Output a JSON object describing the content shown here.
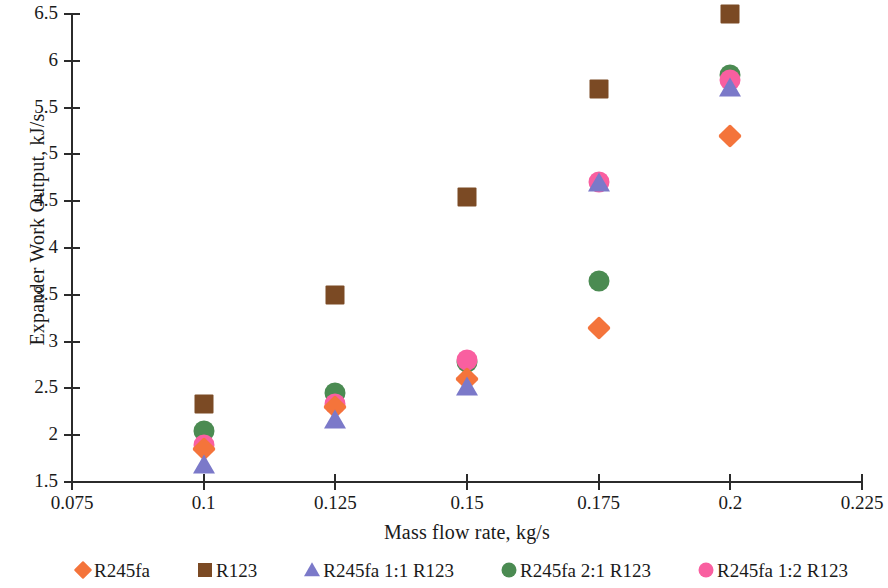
{
  "chart_data": {
    "type": "scatter",
    "title": "",
    "xlabel": "Mass flow rate, kg/s",
    "ylabel": "Expander Work Output, kJ/s",
    "x": [
      0.1,
      0.125,
      0.15,
      0.175,
      0.2
    ],
    "xlim": [
      0.075,
      0.225
    ],
    "ylim": [
      1.5,
      6.5
    ],
    "xticks": [
      "0.075",
      "0.1",
      "0.125",
      "0.15",
      "0.175",
      "0.2",
      "0.225"
    ],
    "xtick_values": [
      0.075,
      0.1,
      0.125,
      0.15,
      0.175,
      0.2,
      0.225
    ],
    "yticks": [
      "1.5",
      "2",
      "2.5",
      "3",
      "3.5",
      "4",
      "4.5",
      "5",
      "5.5",
      "6",
      "6.5"
    ],
    "ytick_values": [
      1.5,
      2,
      2.5,
      3,
      3.5,
      4,
      4.5,
      5,
      5.5,
      6,
      6.5
    ],
    "grid": false,
    "legend_position": "bottom",
    "series": [
      {
        "name": "R245fa",
        "marker": "diamond",
        "color": "#F4743B",
        "values": [
          1.85,
          2.3,
          2.6,
          3.15,
          5.2
        ]
      },
      {
        "name": "R123",
        "marker": "square",
        "color": "#7B4A24",
        "values": [
          2.33,
          3.5,
          4.55,
          5.7,
          6.5
        ]
      },
      {
        "name": "R245fa 1:1 R123",
        "marker": "triangle",
        "color": "#7B79C9",
        "values": [
          1.67,
          2.15,
          2.5,
          4.68,
          5.7
        ]
      },
      {
        "name": "R245fa 2:1 R123",
        "marker": "circle",
        "color": "#4B8B52",
        "values": [
          2.05,
          2.45,
          2.78,
          3.65,
          5.85
        ]
      },
      {
        "name": "R245fa 1:2 R123",
        "marker": "circle",
        "color": "#F95FA0",
        "values": [
          1.9,
          2.33,
          2.8,
          4.7,
          5.8
        ]
      }
    ]
  },
  "legend": {
    "items": [
      {
        "label": "R245fa",
        "marker": "diamond",
        "color": "#F4743B"
      },
      {
        "label": "R123",
        "marker": "square",
        "color": "#7B4A24"
      },
      {
        "label": "R245fa 1:1 R123",
        "marker": "triangle",
        "color": "#7B79C9"
      },
      {
        "label": "R245fa 2:1 R123",
        "marker": "circle",
        "color": "#4B8B52"
      },
      {
        "label": "R245fa 1:2 R123",
        "marker": "circle",
        "color": "#F95FA0"
      }
    ]
  },
  "axes": {
    "y_title": "Expander Work Output, kJ/s",
    "x_title": "Mass flow rate, kg/s"
  }
}
